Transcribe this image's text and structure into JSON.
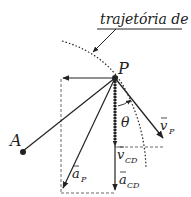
{
  "diagram": {
    "trajectory_label": "trajetória de P",
    "point_P": "P",
    "point_A": "A",
    "angle": "θ",
    "vectors": {
      "v_P": {
        "symbol": "v",
        "subscript": "P"
      },
      "v_CD": {
        "symbol": "v",
        "subscript": "CD"
      },
      "a_P": {
        "symbol": "a",
        "subscript": "P"
      },
      "a_CD": {
        "symbol": "a",
        "subscript": "CD"
      }
    },
    "colors": {
      "stroke": "#222222",
      "background": "#ffffff"
    }
  }
}
